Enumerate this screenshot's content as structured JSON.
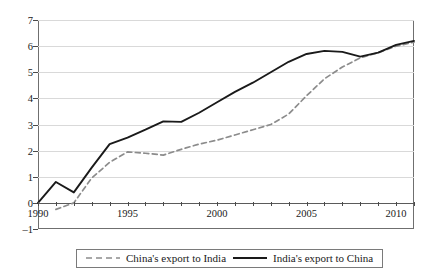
{
  "chart_data": {
    "type": "line",
    "title": "",
    "subtitle": "",
    "xlabel": "",
    "ylabel": "",
    "xlim": [
      1990,
      2011
    ],
    "ylim": [
      -1,
      7
    ],
    "ytick_labels": [
      "7",
      "6",
      "5",
      "4",
      "3",
      "2",
      "1",
      "0",
      "–1"
    ],
    "ytick_values": [
      7,
      6,
      5,
      4,
      3,
      2,
      1,
      0,
      -1
    ],
    "xtick_values": [
      1990,
      1991,
      1992,
      1993,
      1994,
      1995,
      1996,
      1997,
      1998,
      1999,
      2000,
      2001,
      2002,
      2003,
      2004,
      2005,
      2006,
      2007,
      2008,
      2009,
      2010,
      2011
    ],
    "xtick_labels": [
      "1990",
      "1995",
      "2000",
      "2005",
      "2010"
    ],
    "xtick_label_values": [
      1990,
      1995,
      2000,
      2005,
      2010
    ],
    "grid": true,
    "zero_line": true,
    "legend_position": "bottom-center",
    "x": [
      1990,
      1991,
      1992,
      1993,
      1994,
      1995,
      1996,
      1997,
      1998,
      1999,
      2000,
      2001,
      2002,
      2003,
      2004,
      2005,
      2006,
      2007,
      2008,
      2009,
      2010,
      2011
    ],
    "series": [
      {
        "name": "China's export to India",
        "style": "dashed",
        "color": "#8c8c8c",
        "values": [
          null,
          -0.25,
          0.0,
          0.95,
          1.55,
          1.95,
          1.9,
          1.83,
          2.05,
          2.25,
          2.4,
          2.6,
          2.8,
          3.0,
          3.4,
          4.1,
          4.75,
          5.2,
          5.55,
          5.75,
          6.0,
          6.15
        ]
      },
      {
        "name": "India's export to China",
        "style": "solid",
        "color": "#1a1a1a",
        "values": [
          0.0,
          0.8,
          0.4,
          1.35,
          2.25,
          2.5,
          2.8,
          3.12,
          3.1,
          3.45,
          3.85,
          4.25,
          4.6,
          5.0,
          5.4,
          5.7,
          5.82,
          5.78,
          5.6,
          5.75,
          6.05,
          6.2
        ]
      }
    ]
  },
  "legend": {
    "items": [
      {
        "label": "China's export to India",
        "swatch": "dashed-line-swatch"
      },
      {
        "label": "India's export to China",
        "swatch": "solid-line-swatch"
      }
    ]
  }
}
